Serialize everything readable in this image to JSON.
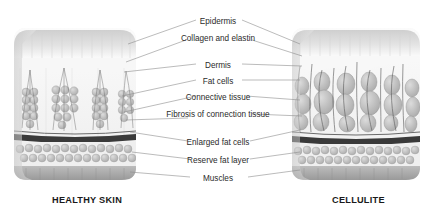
{
  "diagram": {
    "background": "#ffffff",
    "ink": "#2b2b2b",
    "line_color": "#8d8d8d",
    "fascia_color": "#3a3a3a",
    "skin_light": "#f2f2f2",
    "fat_gray": "#b9b9b9",
    "muscle_gray": "#a9a9a9"
  },
  "captions": {
    "left": "HEALTHY SKIN",
    "right": "CELLULITE"
  },
  "labels": [
    {
      "text": "Epidermis",
      "top": 17
    },
    {
      "text": "Collagen and elastin",
      "top": 34
    },
    {
      "text": "Dermis",
      "top": 61
    },
    {
      "text": "Fat cells",
      "top": 77
    },
    {
      "text": "Connective tissue",
      "top": 93
    },
    {
      "text": "Fibrosis of connection tissue",
      "top": 110
    },
    {
      "text": "Enlarged fat cells",
      "top": 138
    },
    {
      "text": "Reserve fat layer",
      "top": 156
    },
    {
      "text": "Muscles",
      "top": 174
    }
  ],
  "panels": [
    {
      "name": "healthy-skin-block",
      "side": "left"
    },
    {
      "name": "cellulite-block",
      "side": "right"
    }
  ]
}
